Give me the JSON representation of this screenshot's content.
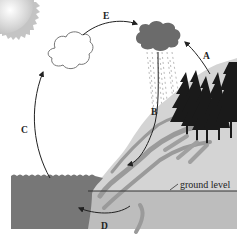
{
  "diagram": {
    "labels": {
      "A": "A",
      "B": "B",
      "C": "C",
      "D": "D",
      "E": "E",
      "ground_level": "ground level"
    },
    "elements": [
      {
        "name": "sun",
        "icon": "sun-icon"
      },
      {
        "name": "white-cloud",
        "icon": "cloud-icon"
      },
      {
        "name": "rain-cloud",
        "icon": "rain-cloud-icon"
      },
      {
        "name": "rain",
        "icon": "rain-icon"
      },
      {
        "name": "trees",
        "icon": "tree-icon"
      },
      {
        "name": "hill",
        "icon": "hill-icon"
      },
      {
        "name": "ocean",
        "icon": "water-icon"
      },
      {
        "name": "groundwater-flow",
        "icon": "groundwater-icon"
      }
    ],
    "arrows": [
      {
        "label": "A",
        "from": "trees",
        "to": "rain-cloud"
      },
      {
        "label": "B",
        "from": "rain-cloud",
        "to": "hill"
      },
      {
        "label": "C",
        "from": "ocean",
        "to": "white-cloud"
      },
      {
        "label": "D",
        "from": "ground",
        "to": "ocean"
      },
      {
        "label": "E",
        "from": "white-cloud",
        "to": "rain-cloud"
      }
    ],
    "colors": {
      "background": "#ffffff",
      "ocean": "#777777",
      "rain_cloud": "#6b6b6b",
      "land": "#cfcfcf",
      "underground": "#bdbdbd",
      "stream": "#9a9a9a",
      "trees": "#1a1a1a",
      "sun": "#c9c9c9",
      "line": "#222222"
    }
  }
}
